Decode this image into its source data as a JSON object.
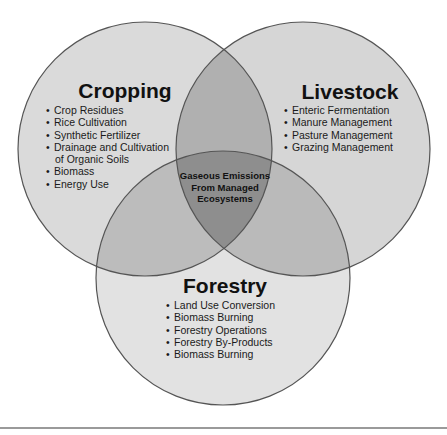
{
  "diagram": {
    "type": "venn",
    "center_label": "Gaseous Emissions From Managed Ecosystems",
    "center_label_lines": [
      "Gaseous Emissions",
      "From Managed",
      "Ecosystems"
    ],
    "circles": [
      {
        "id": "cropping",
        "title": "Cropping",
        "items": [
          "Crop Residues",
          "Rice Cultivation",
          "Synthetic Fertilizer",
          "Drainage and Cultivation",
          "of Organic Soils",
          "Biomass",
          "Energy Use"
        ]
      },
      {
        "id": "livestock",
        "title": "Livestock",
        "items": [
          "Enteric Fermentation",
          "Manure Management",
          "Pasture Management",
          "Grazing Management"
        ]
      },
      {
        "id": "forestry",
        "title": "Forestry",
        "items": [
          "Land Use Conversion",
          "Biomass Burning",
          "Forestry Operations",
          "Forestry By-Products",
          "Biomass Burning"
        ]
      }
    ],
    "colors": {
      "single": "#d9d9d9",
      "double": "#b3b3b3",
      "triple": "#8f8f8f",
      "outline": "#555555",
      "background": "#ffffff"
    }
  }
}
